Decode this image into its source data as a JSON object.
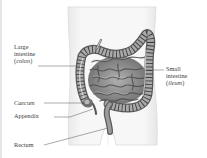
{
  "diagram": {
    "labels": {
      "large_intestine": {
        "line1": "Large",
        "line2": "intestine",
        "line3_open": "(",
        "line3_italic": "colon",
        "line3_close": ")"
      },
      "small_intestine": {
        "line1": "Small",
        "line2": "intestine",
        "line3_open": "(",
        "line3_italic": "ileum",
        "line3_close": ")"
      },
      "caecum": "Caecum",
      "appendix": "Appendix",
      "rectum": "Rectum"
    },
    "colors": {
      "body_fill": "#f4f4f4",
      "body_outline": "#d8d8d8",
      "organ_dark": "#5a5a5a",
      "organ_mid": "#8c8c8c",
      "organ_light": "#c4c4c4",
      "label_text": "#3a3a3a",
      "leader_line": "#555555"
    }
  }
}
